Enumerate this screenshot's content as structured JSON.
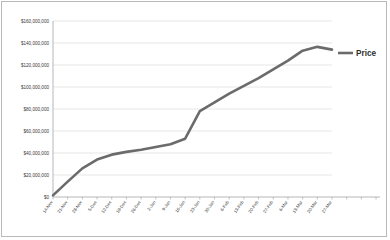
{
  "chart_data": {
    "type": "line",
    "title": "",
    "xlabel": "",
    "ylabel": "",
    "grid": true,
    "legend_position": "right",
    "ylim": [
      0,
      160000000
    ],
    "ytick_values": [
      0,
      20000000,
      40000000,
      60000000,
      80000000,
      100000000,
      120000000,
      140000000,
      160000000
    ],
    "ytick_labels": [
      "$0",
      "$20,000,000",
      "$40,000,000",
      "$60,000,000",
      "$80,000,000",
      "$100,000,000",
      "$120,000,000",
      "$140,000,000",
      "$160,000,000"
    ],
    "categories": [
      "14-Nov",
      "21-Nov",
      "28-Nov",
      "5-Dec",
      "12-Dec",
      "19-Dec",
      "26-Dec",
      "2-Jan",
      "9-Jan",
      "16-Jan",
      "23-Jan",
      "30-Jan",
      "6-Feb",
      "13-Feb",
      "20-Feb",
      "27-Feb",
      "6-Mar",
      "13-Mar",
      "20-Mar",
      "27-Mar"
    ],
    "series": [
      {
        "name": "Price",
        "color": "#6b6b6b",
        "values": [
          1500000,
          14000000,
          26000000,
          34000000,
          38500000,
          41000000,
          43000000,
          45500000,
          48000000,
          53000000,
          78000000,
          86000000,
          94000000,
          101000000,
          108000000,
          116000000,
          124000000,
          133000000,
          136500000,
          134000000
        ]
      }
    ],
    "legend": [
      {
        "label": "Price",
        "color": "#6b6b6b"
      }
    ]
  }
}
